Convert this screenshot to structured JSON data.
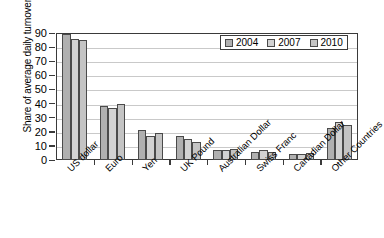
{
  "chart_data": {
    "type": "bar",
    "title": "",
    "xlabel": "",
    "ylabel": "Share of average daily turnover (%)",
    "ylim": [
      0,
      90
    ],
    "yticks": [
      0,
      10,
      20,
      30,
      40,
      50,
      60,
      70,
      80,
      90
    ],
    "ytick_labels": [
      "0",
      "10",
      "20",
      "30",
      "40",
      "50",
      "60",
      "70",
      "80",
      "90"
    ],
    "grid": true,
    "legend_position": "top-right",
    "categories": [
      "US dollar",
      "Euro",
      "Yen",
      "UK Pound",
      "Australian Dollar",
      "Swiss Franc",
      "Canadian Dollar",
      "Other Countries"
    ],
    "series": [
      {
        "name": "2004",
        "color": "#b0b0b0",
        "values": [
          89,
          38,
          21,
          17,
          7,
          6,
          4,
          23
        ]
      },
      {
        "name": "2007",
        "color": "#d2d2d2",
        "values": [
          86,
          37,
          17,
          15,
          7,
          7,
          4,
          27
        ]
      },
      {
        "name": "2010",
        "color": "#c4c4c4",
        "values": [
          85,
          40,
          19,
          13,
          8,
          6,
          5,
          25
        ]
      }
    ],
    "legend": [
      {
        "label": "2004",
        "color": "#b0b0b0"
      },
      {
        "label": "2007",
        "color": "#d2d2d2"
      },
      {
        "label": "2010",
        "color": "#c4c4c4"
      }
    ],
    "axis_color": "#3a3a3a",
    "grid_color": "#c9c9c9",
    "bar_edge_color": "#4a4a4a",
    "background": "#ffffff"
  }
}
